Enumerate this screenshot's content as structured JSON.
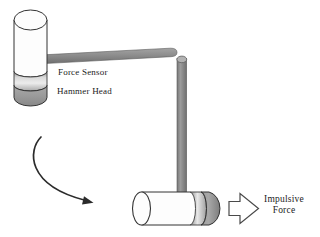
{
  "figure": {
    "labels": {
      "force_sensor": "Force Sensor",
      "hammer_head": "Hammer Head",
      "impulsive_line1": "Impulsive",
      "impulsive_line2": "Force"
    },
    "colors": {
      "background": "#ffffff",
      "outline": "#333333",
      "cylinder_white": "#fdfdfd",
      "rod_gray": "#8d8d8d",
      "sensor_band_light": "#e8e8e8",
      "sensor_band_dark": "#8e8e8e",
      "head_gray": "#9b9b9b",
      "arrow_dark": "#2b2b2b",
      "impulse_arrow_fill": "#ffffff",
      "impulse_arrow_stroke": "#4a4a4a",
      "text": "#1b1b1b"
    }
  }
}
